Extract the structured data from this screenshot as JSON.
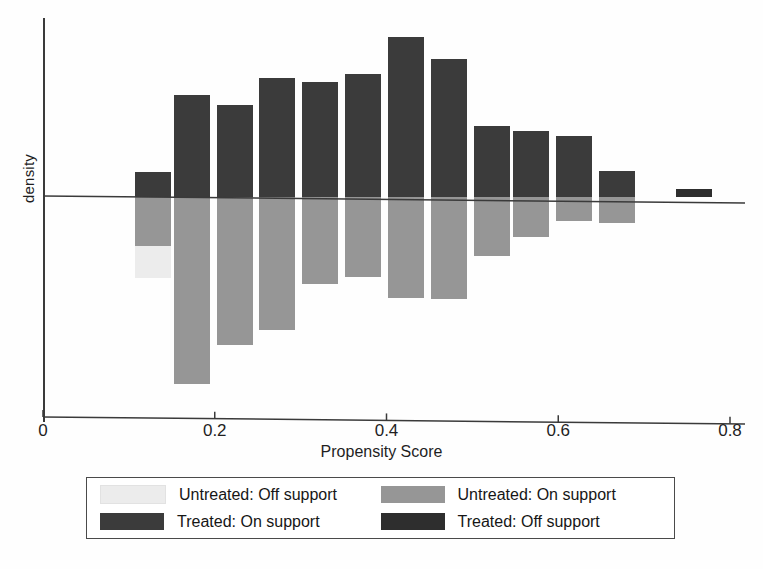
{
  "chart_data": {
    "type": "bar",
    "title": "",
    "subtitle": "",
    "xlabel": "Propensity Score",
    "ylabel": "density",
    "orientation": "vertical-mirrored-histogram",
    "grid": false,
    "xlim": [
      0,
      0.8
    ],
    "xticks": [
      0,
      0.2,
      0.4,
      0.6,
      0.8
    ],
    "xtick_labels": [
      "0",
      "0.2",
      "0.4",
      "0.6",
      "0.8"
    ],
    "yticks": [],
    "ytick_labels": [],
    "legend_position": "below-axes",
    "bin_width": 0.04,
    "note": "Mirrored density histogram: treated plotted above the zero line, untreated plotted below. Densities are read off bar extents relative to the zero line (arbitrary density units).",
    "series": [
      {
        "name": "Treated: On support",
        "color": "#3b3b3b",
        "direction": "up",
        "bin_centers": [
          0.128,
          0.173,
          0.223,
          0.273,
          0.323,
          0.373,
          0.423,
          0.473,
          0.523,
          0.568,
          0.618,
          0.668
        ],
        "values": [
          0.6,
          2.44,
          2.18,
          2.84,
          2.74,
          2.94,
          3.8,
          3.28,
          1.7,
          1.58,
          1.46,
          0.62
        ]
      },
      {
        "name": "Treated: Off support",
        "color": "#2e2e2e",
        "direction": "up",
        "bin_centers": [
          0.758
        ],
        "values": [
          0.18
        ]
      },
      {
        "name": "Untreated: On support",
        "color": "#969696",
        "direction": "down",
        "bin_centers": [
          0.128,
          0.173,
          0.223,
          0.273,
          0.323,
          0.373,
          0.423,
          0.473,
          0.523,
          0.568,
          0.618,
          0.668
        ],
        "values": [
          1.16,
          4.46,
          3.52,
          3.16,
          2.06,
          1.9,
          2.4,
          2.42,
          1.4,
          0.96,
          0.58,
          0.62
        ]
      },
      {
        "name": "Untreated: Off support",
        "color": "#ececec",
        "direction": "down",
        "stacked_below": "Untreated: On support",
        "bin_centers": [
          0.128
        ],
        "values": [
          0.76
        ]
      }
    ]
  },
  "axes": {
    "x_title": "Propensity Score",
    "y_title": "density",
    "x_tick_labels": [
      "0",
      "0.2",
      "0.4",
      "0.6",
      "0.8"
    ]
  },
  "legend": {
    "entries": [
      {
        "label": "Untreated: Off support",
        "color": "#ececec"
      },
      {
        "label": "Untreated: On support",
        "color": "#969696"
      },
      {
        "label": "Treated: On support",
        "color": "#3b3b3b"
      },
      {
        "label": "Treated: Off support",
        "color": "#2e2e2e"
      }
    ]
  },
  "colors": {
    "treated_on": "#3b3b3b",
    "treated_off": "#2e2e2e",
    "untreated_on": "#969696",
    "untreated_off": "#ececec",
    "axis": "#3a3a3a",
    "background": "#fefefe"
  }
}
